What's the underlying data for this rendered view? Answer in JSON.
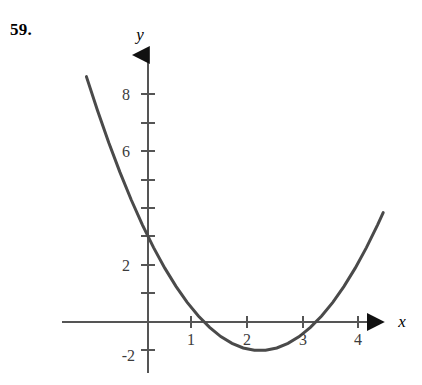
{
  "problem": {
    "number": "59."
  },
  "chart_data": {
    "type": "line",
    "title": "",
    "subtitle": "",
    "xlabel": "x",
    "ylabel": "y",
    "function": "y = x^2 - 4x + 3",
    "grid": false,
    "legend": null,
    "xlim": [
      -1.55,
      4.3
    ],
    "ylim": [
      -2.6,
      9.6
    ],
    "x_ticks": [
      1,
      2,
      3,
      4
    ],
    "x_tick_labels": [
      "1",
      "2",
      "3",
      "4"
    ],
    "x_minor_ticks": [],
    "y_ticks": [
      -2,
      2,
      6,
      8
    ],
    "y_tick_labels": [
      "-2",
      "2",
      "6",
      "8"
    ],
    "y_minor_ticks": [
      -1,
      1,
      3,
      4,
      5,
      7,
      9
    ],
    "roots": [
      1,
      3
    ],
    "vertex": [
      2,
      -1
    ],
    "y_intercept": 3,
    "x_domain_drawn": [
      -1.1,
      4.2
    ],
    "curve_color": "#4a4a4a",
    "axis_color": "#555555",
    "x": [
      -1.1,
      -0.9,
      -0.7,
      -0.5,
      -0.3,
      -0.1,
      0.1,
      0.3,
      0.5,
      0.7,
      0.9,
      1.1,
      1.3,
      1.5,
      1.7,
      1.9,
      2.1,
      2.3,
      2.5,
      2.7,
      2.9,
      3.1,
      3.3,
      3.5,
      3.7,
      3.9,
      4.1,
      4.2
    ],
    "y": [
      8.61,
      7.41,
      6.29,
      5.25,
      4.29,
      3.41,
      2.61,
      1.89,
      1.25,
      0.69,
      0.21,
      -0.19,
      -0.51,
      -0.75,
      -0.91,
      -0.99,
      -0.99,
      -0.91,
      -0.75,
      -0.51,
      -0.19,
      0.21,
      0.69,
      1.25,
      1.89,
      2.61,
      3.41,
      3.84
    ]
  }
}
